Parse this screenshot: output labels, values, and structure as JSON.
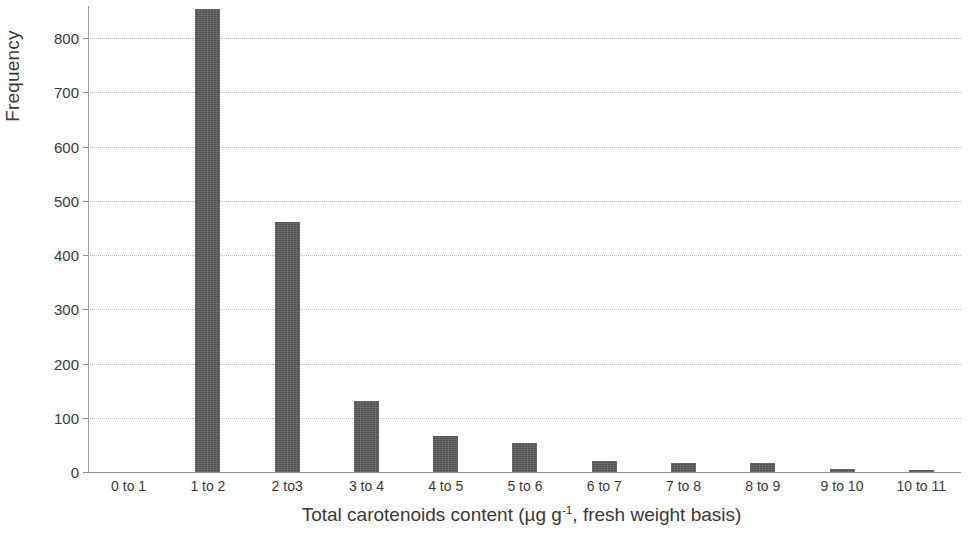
{
  "chart_data": {
    "type": "bar",
    "title": "",
    "subtitle": "",
    "xlabel": "Total carotenoids content (µg g⁻¹, fresh weight basis)",
    "xlabel_parts": {
      "before": "Total carotenoids content (µg g",
      "superscript": "-1",
      "after": ", fresh weight basis)"
    },
    "ylabel": "Frequency",
    "categories": [
      "0 to 1",
      "1 to 2",
      "2 to3",
      "3 to 4",
      "4 to 5",
      "5 to 6",
      "6 to 7",
      "7 to 8",
      "8 to 9",
      "9 to 10",
      "10 to 11"
    ],
    "values": [
      0,
      853,
      461,
      131,
      66,
      53,
      20,
      16,
      16,
      5,
      4
    ],
    "ylim": [
      0,
      860
    ],
    "ytick_labels": [
      "0",
      "100",
      "200",
      "300",
      "400",
      "500",
      "600",
      "700",
      "800"
    ],
    "ytick_values": [
      0,
      100,
      200,
      300,
      400,
      500,
      600,
      700,
      800
    ],
    "grid": "horizontal-dotted",
    "legend": "none",
    "bar_color": "#585858",
    "grid_color": "#b9b9b9",
    "axis_color": "#8f8f8f"
  }
}
